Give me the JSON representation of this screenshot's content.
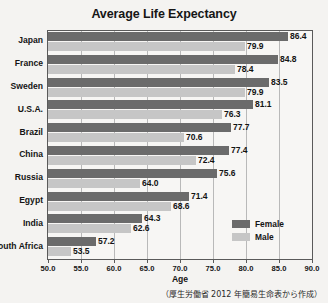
{
  "chart_data": {
    "type": "bar",
    "orientation": "horizontal",
    "title": "Average Life Expectancy",
    "xlabel": "Age",
    "ylabel": "",
    "xlim": [
      50.0,
      90.0
    ],
    "xticks": [
      "50.0",
      "55.0",
      "60.0",
      "65.0",
      "70.0",
      "75.0",
      "80.0",
      "85.0",
      "90.0"
    ],
    "grid": true,
    "legend_position": "inside-bottom-right",
    "categories": [
      "Japan",
      "France",
      "Sweden",
      "U.S.A.",
      "Brazil",
      "China",
      "Russia",
      "Egypt",
      "India",
      "South Africa"
    ],
    "series": [
      {
        "name": "Female",
        "color": "#6b6b6b",
        "values": [
          86.4,
          84.8,
          83.5,
          81.1,
          77.7,
          77.4,
          75.6,
          71.4,
          64.3,
          57.2
        ],
        "labels": [
          "86.4",
          "84.8",
          "83.5",
          "81.1",
          "77.7",
          "77.4",
          "75.6",
          "71.4",
          "64.3",
          "57.2"
        ]
      },
      {
        "name": "Male",
        "color": "#c6c6c6",
        "values": [
          79.9,
          78.4,
          79.9,
          76.3,
          70.6,
          72.4,
          64.0,
          68.6,
          62.6,
          53.5
        ],
        "labels": [
          "79.9",
          "78.4",
          "79.9",
          "76.3",
          "70.6",
          "72.4",
          "64.0",
          "68.6",
          "62.6",
          "53.5"
        ]
      }
    ],
    "footnote": "（厚生労働省 2012 年簡易生命表から作成）"
  }
}
